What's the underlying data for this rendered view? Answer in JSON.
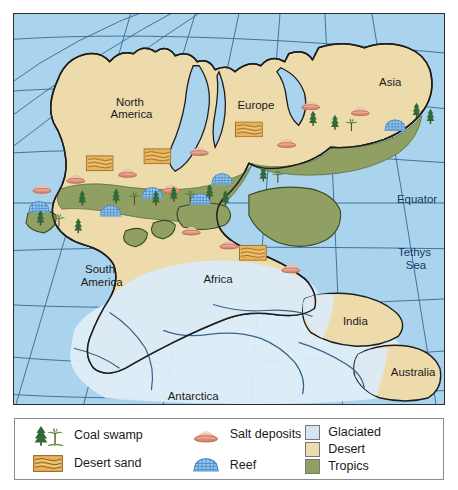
{
  "map": {
    "title": "Pangaea paleoclimate map",
    "continent_labels": [
      {
        "name": "North America",
        "lines": [
          "North",
          "America"
        ],
        "x": 118,
        "y": 92
      },
      {
        "name": "Europe",
        "lines": [
          "Europe"
        ],
        "x": 243,
        "y": 96
      },
      {
        "name": "Asia",
        "lines": [
          "Asia"
        ],
        "x": 378,
        "y": 72
      },
      {
        "name": "South America",
        "lines": [
          "South",
          "America"
        ],
        "x": 88,
        "y": 260
      },
      {
        "name": "Africa",
        "lines": [
          "Africa"
        ],
        "x": 205,
        "y": 270
      },
      {
        "name": "India",
        "lines": [
          "India"
        ],
        "x": 343,
        "y": 313
      },
      {
        "name": "Australia",
        "lines": [
          "Australia"
        ],
        "x": 401,
        "y": 364
      },
      {
        "name": "Antarctica",
        "lines": [
          "Antarctica"
        ],
        "x": 180,
        "y": 388
      }
    ],
    "ocean_labels": [
      {
        "name": "Equator",
        "lines": [
          "Equator"
        ],
        "x": 405,
        "y": 190
      },
      {
        "name": "Tethys Sea",
        "lines": [
          "Tethys",
          "Sea"
        ],
        "x": 404,
        "y": 243
      }
    ],
    "colors": {
      "ocean": "#aad4ee",
      "desert": "#eedbac",
      "tropics": "#90a062",
      "glaciated": "#d9e9f4",
      "coastline": "#1d1d1d",
      "graticule": "#31618f",
      "salt": "#e39b85",
      "reef": "#6aa7dd",
      "sand_symbol": "#d98f2c",
      "tree": "#2f6b3a"
    }
  },
  "legend": {
    "items": [
      {
        "icon": "coal-swamp-icon",
        "label": "Coal swamp"
      },
      {
        "icon": "desert-sand-icon",
        "label": "Desert sand"
      },
      {
        "icon": "salt-deposits-icon",
        "label": "Salt deposits"
      },
      {
        "icon": "reef-icon",
        "label": "Reef"
      },
      {
        "icon": "glaciated-swatch",
        "label": "Glaciated"
      },
      {
        "icon": "desert-swatch",
        "label": "Desert"
      },
      {
        "icon": "tropics-swatch",
        "label": "Tropics"
      }
    ],
    "coal_swamp_label": "Coal swamp",
    "desert_sand_label": "Desert sand",
    "salt_deposits_label": "Salt deposits",
    "reef_label": "Reef",
    "glaciated_label": "Glaciated",
    "desert_label": "Desert",
    "tropics_label": "Tropics"
  }
}
